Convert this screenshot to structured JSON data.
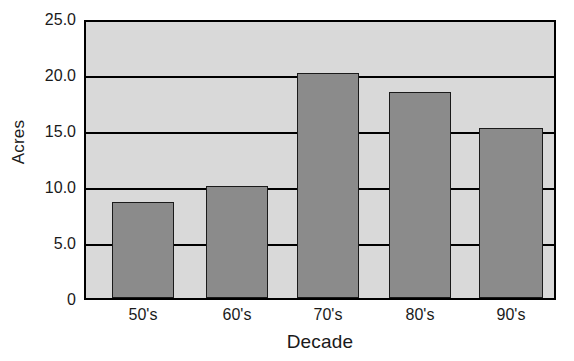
{
  "chart_data": {
    "type": "bar",
    "title": "",
    "xlabel": "Decade",
    "ylabel": "Acres",
    "categories": [
      "50's",
      "60's",
      "70's",
      "80's",
      "90's"
    ],
    "values": [
      8.6,
      10.0,
      20.1,
      18.4,
      15.2
    ],
    "ylim": [
      0,
      25.0
    ],
    "ytick_labels": [
      "25.0",
      "20.0",
      "15.0",
      "10.0",
      "5.0",
      "0"
    ],
    "ytick_values": [
      25.0,
      20.0,
      15.0,
      10.0,
      5.0,
      0
    ],
    "grid": true,
    "legend": "none",
    "colors": {
      "bar_fill": "#8b8b8b",
      "bar_edge": "#1a1a1a",
      "plot_background": "#d9d9d9",
      "axis": "#000000",
      "text": "#1a1a1a"
    }
  }
}
